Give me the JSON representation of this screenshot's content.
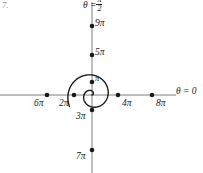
{
  "figure": {
    "problem_number": "7.",
    "background_color": "#ffffff",
    "ink_color": "#1a1a1a",
    "axis_color": "#6f6f6f"
  },
  "axes": {
    "polar_axis_label": "θ = 0",
    "vertical_axis_label_prefix": "θ =",
    "vertical_axis_fraction_numerator": "π",
    "vertical_axis_fraction_denominator": "2",
    "origin_x": 92,
    "origin_y": 95
  },
  "chart_data": {
    "type": "line",
    "plot_kind": "polar-spiral",
    "title": "",
    "subtitle": "",
    "xlabel": "θ = 0",
    "ylabel": "θ = π/2",
    "equation": "r = θ",
    "theta_range_radians": [
      0,
      9.9
    ],
    "grid": false,
    "legend": null,
    "annotations": [
      "θ = 0",
      "θ = π/2"
    ],
    "marked_points": [
      {
        "label": "π",
        "theta_over_pi": 1,
        "r_over_pi": 1,
        "direction": "up",
        "px_x": 92,
        "px_y": 82
      },
      {
        "label": "2π",
        "theta_over_pi": 2,
        "r_over_pi": 2,
        "direction": "left",
        "px_x": 74,
        "px_y": 95
      },
      {
        "label": "3π",
        "theta_over_pi": 3,
        "r_over_pi": 3,
        "direction": "down",
        "px_x": 92,
        "px_y": 110
      },
      {
        "label": "4π",
        "theta_over_pi": 4,
        "r_over_pi": 4,
        "direction": "right",
        "px_x": 118,
        "px_y": 95
      },
      {
        "label": "5π",
        "theta_over_pi": 5,
        "r_over_pi": 5,
        "direction": "up",
        "px_x": 92,
        "px_y": 55
      },
      {
        "label": "6π",
        "theta_over_pi": 6,
        "r_over_pi": 6,
        "direction": "left",
        "px_x": 47,
        "px_y": 95
      },
      {
        "label": "7π",
        "theta_over_pi": 7,
        "r_over_pi": 7,
        "direction": "down",
        "px_x": 92,
        "px_y": 150
      },
      {
        "label": "8π",
        "theta_over_pi": 8,
        "r_over_pi": 8,
        "direction": "right",
        "px_x": 152,
        "px_y": 95
      },
      {
        "label": "9π",
        "theta_over_pi": 9,
        "r_over_pi": 9,
        "direction": "up",
        "px_x": 92,
        "px_y": 26
      }
    ],
    "tick_labels_horizontal": [
      "6π",
      "2π",
      "4π",
      "8π"
    ],
    "tick_labels_vertical": [
      "9π",
      "5π",
      "π",
      "3π",
      "7π"
    ]
  }
}
